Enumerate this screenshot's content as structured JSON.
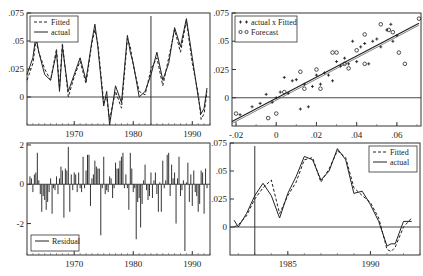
{
  "chart_data": [
    {
      "panel": "top-left",
      "type": "line",
      "title": "",
      "xlabel": "",
      "ylabel": "",
      "xlim": [
        1962,
        1993
      ],
      "ylim": [
        -0.025,
        0.075
      ],
      "xticks": [
        "1970",
        "1980",
        "1990"
      ],
      "yticks": [
        ".075",
        ".05",
        ".025",
        "0"
      ],
      "legend": [
        "Fitted",
        "actual"
      ],
      "legend_position": "upper-left",
      "vline_at": 1983,
      "x": [
        1962,
        1963,
        1963.5,
        1964,
        1965,
        1966,
        1967,
        1967.5,
        1968,
        1969,
        1970,
        1971,
        1972,
        1973,
        1973.5,
        1974,
        1975,
        1975.5,
        1976,
        1977,
        1978,
        1979,
        1979.5,
        1980,
        1981,
        1982,
        1983,
        1984,
        1985,
        1986,
        1987,
        1988,
        1989,
        1990,
        1991,
        1991.5,
        1992,
        1992.5
      ],
      "series": [
        {
          "name": "actual",
          "values": [
            0.02,
            0.035,
            0.055,
            0.04,
            0.02,
            0.015,
            0.04,
            0.005,
            0.045,
            0.005,
            0.02,
            0.035,
            0.015,
            0.05,
            0.065,
            0.045,
            -0.008,
            0.005,
            -0.025,
            0.01,
            -0.005,
            0.055,
            0.04,
            0.03,
            0.0,
            0.005,
            0.02,
            0.04,
            0.015,
            0.03,
            0.062,
            0.045,
            0.07,
            0.035,
            0.0,
            -0.015,
            -0.01,
            0.008
          ]
        },
        {
          "name": "Fitted",
          "values": [
            0.015,
            0.03,
            0.05,
            0.04,
            0.025,
            0.015,
            0.043,
            0.008,
            0.048,
            0.0,
            0.018,
            0.032,
            0.012,
            0.048,
            0.06,
            0.048,
            -0.005,
            0.0,
            -0.02,
            0.005,
            -0.01,
            0.052,
            0.045,
            0.028,
            0.005,
            0.002,
            0.025,
            0.035,
            0.01,
            0.035,
            0.06,
            0.04,
            0.068,
            0.03,
            0.003,
            -0.02,
            -0.015,
            0.005
          ]
        }
      ]
    },
    {
      "panel": "top-right",
      "type": "scatter",
      "xlim": [
        -0.022,
        0.072
      ],
      "ylim": [
        -0.025,
        0.075
      ],
      "xticks": [
        "-.02",
        "0",
        ".02",
        ".04",
        ".06"
      ],
      "yticks": [
        ".075",
        ".05",
        ".025",
        "0"
      ],
      "legend": [
        "actual x Fitted",
        "Forecast"
      ],
      "legend_position": "upper-left",
      "series": [
        {
          "name": "actual x Fitted",
          "marker": "+",
          "points": [
            [
              -0.018,
              -0.015
            ],
            [
              -0.012,
              -0.008
            ],
            [
              -0.008,
              -0.005
            ],
            [
              -0.005,
              0.003
            ],
            [
              -0.002,
              -0.004
            ],
            [
              0.0,
              0.0
            ],
            [
              0.002,
              0.005
            ],
            [
              0.004,
              0.018
            ],
            [
              0.006,
              0.004
            ],
            [
              0.008,
              0.015
            ],
            [
              0.01,
              0.016
            ],
            [
              0.012,
              -0.01
            ],
            [
              0.014,
              0.012
            ],
            [
              0.016,
              -0.008
            ],
            [
              0.018,
              0.01
            ],
            [
              0.02,
              0.02
            ],
            [
              0.022,
              0.012
            ],
            [
              0.024,
              0.022
            ],
            [
              0.026,
              0.02
            ],
            [
              0.028,
              0.015
            ],
            [
              0.03,
              0.032
            ],
            [
              0.032,
              0.028
            ],
            [
              0.034,
              0.035
            ],
            [
              0.036,
              0.03
            ],
            [
              0.038,
              0.05
            ],
            [
              0.04,
              0.032
            ],
            [
              0.042,
              0.045
            ],
            [
              0.044,
              0.048
            ],
            [
              0.046,
              0.03
            ],
            [
              0.048,
              0.05
            ],
            [
              0.05,
              0.052
            ],
            [
              0.052,
              0.045
            ],
            [
              0.055,
              0.06
            ],
            [
              0.057,
              0.065
            ],
            [
              0.058,
              0.05
            ],
            [
              0.06,
              0.055
            ]
          ]
        },
        {
          "name": "Forecast",
          "marker": "o",
          "points": [
            [
              -0.02,
              -0.014
            ],
            [
              -0.004,
              -0.018
            ],
            [
              0.0,
              -0.014
            ],
            [
              0.004,
              0.005
            ],
            [
              0.012,
              0.023
            ],
            [
              0.014,
              0.008
            ],
            [
              0.02,
              0.025
            ],
            [
              0.022,
              0.008
            ],
            [
              0.028,
              0.04
            ],
            [
              0.03,
              0.04
            ],
            [
              0.034,
              0.03
            ],
            [
              0.036,
              0.026
            ],
            [
              0.04,
              0.042
            ],
            [
              0.044,
              0.056
            ],
            [
              0.044,
              0.03
            ],
            [
              0.052,
              0.065
            ],
            [
              0.056,
              0.06
            ],
            [
              0.058,
              0.058
            ],
            [
              0.061,
              0.04
            ],
            [
              0.064,
              0.03
            ],
            [
              0.071,
              0.07
            ]
          ]
        }
      ],
      "fit_line": {
        "from": [
          -0.022,
          -0.021
        ],
        "to": [
          0.071,
          0.066
        ]
      }
    },
    {
      "panel": "bottom-left",
      "type": "bar",
      "xlim": [
        1962,
        1993
      ],
      "ylim": [
        -3.6,
        2.1
      ],
      "xticks": [
        "1970",
        "1980",
        "1990"
      ],
      "yticks": [
        "2",
        "0",
        "-2"
      ],
      "legend": [
        "Residual"
      ],
      "legend_position": "lower-left",
      "x_start": 1962.5,
      "x_step": 0.25,
      "values": [
        0.4,
        0.3,
        -0.4,
        0.5,
        0.6,
        1.6,
        0.2,
        -0.5,
        -1.4,
        -0.6,
        -0.8,
        -1.3,
        -0.9,
        -0.4,
        0.3,
        -1.5,
        -0.2,
        -0.3,
        0.4,
        -0.5,
        0.3,
        0.9,
        0.7,
        -1.7,
        0.8,
        0.7,
        1.9,
        -1.4,
        0.5,
        -0.3,
        0.6,
        0.5,
        -0.4,
        0.6,
        -0.2,
        -0.4,
        1.4,
        -0.2,
        0.7,
        1.5,
        1.5,
        -1.1,
        0.3,
        0.5,
        1.2,
        0.9,
        0.8,
        0.8,
        -2.6,
        -0.2,
        1.4,
        -0.5,
        -0.3,
        -0.4,
        0.4,
        0.3,
        -0.7,
        -0.2,
        1.1,
        0.8,
        0.8,
        1.2,
        1.4,
        1.6,
        -0.2,
        0.5,
        -0.2,
        -1.3,
        1.6,
        0.8,
        -0.4,
        -0.2,
        -2.8,
        -0.9,
        -0.7,
        -2.2,
        -1.0,
        0.2,
        1.0,
        -0.3,
        -0.8,
        -0.6,
        0.6,
        -0.7,
        0.2,
        0.6,
        -0.5,
        -1.4,
        0.1,
        -1.4,
        1.2,
        -0.2,
        0.2,
        1.5,
        1.6,
        -0.6,
        1.0,
        0.3,
        0.6,
        -2.0,
        0.3,
        1.4,
        -0.6,
        -0.3,
        0.2,
        -3.4,
        0.1,
        1.1,
        -0.9,
        0.5,
        -1.1,
        0.7,
        -0.4,
        -0.6,
        -1.4,
        -1.0,
        0.7,
        0.6,
        -1.5,
        0.8,
        -0.2
      ]
    },
    {
      "panel": "bottom-right",
      "type": "line",
      "xlim": [
        1981.5,
        1993
      ],
      "ylim": [
        -0.025,
        0.075
      ],
      "xticks": [
        "1985",
        "1990"
      ],
      "yticks": [
        ".075",
        ".05",
        ".025",
        "0"
      ],
      "legend": [
        "Fitted",
        "actual"
      ],
      "legend_position": "upper-right",
      "vline_at": 1983,
      "x": [
        1981.75,
        1982,
        1982.5,
        1983,
        1983.5,
        1984,
        1984.5,
        1985,
        1985.5,
        1986,
        1986.5,
        1987,
        1987.5,
        1988,
        1988.5,
        1989,
        1989.5,
        1990,
        1990.5,
        1991,
        1991.25,
        1991.5,
        1992,
        1992.5
      ],
      "series": [
        {
          "name": "actual",
          "values": [
            0.006,
            0.0,
            0.012,
            0.028,
            0.039,
            0.028,
            0.008,
            0.03,
            0.045,
            0.063,
            0.06,
            0.042,
            0.05,
            0.07,
            0.06,
            0.03,
            0.032,
            0.02,
            0.005,
            -0.017,
            -0.015,
            -0.015,
            0.005,
            0.005
          ]
        },
        {
          "name": "Fitted",
          "values": [
            0.0,
            0.002,
            0.01,
            0.025,
            0.035,
            0.042,
            0.012,
            0.028,
            0.04,
            0.06,
            0.062,
            0.04,
            0.052,
            0.068,
            0.062,
            0.035,
            0.028,
            0.022,
            0.008,
            -0.02,
            -0.022,
            -0.018,
            0.0,
            0.008
          ]
        }
      ]
    }
  ]
}
